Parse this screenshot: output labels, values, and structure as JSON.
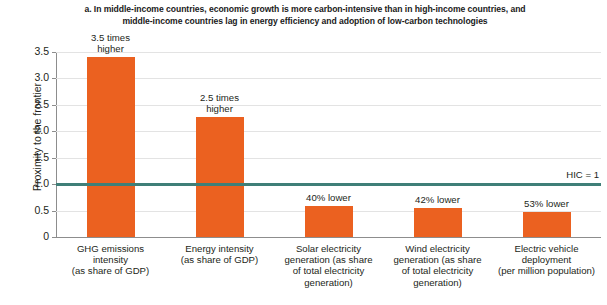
{
  "chart_data": {
    "type": "bar",
    "title": "a. In middle-income countries, economic growth is more carbon-intensive than in high-income countries, and middle-income countries lag in energy efficiency and adoption of low-carbon technologies",
    "title_lines": [
      "a. In middle-income countries, economic growth is more carbon-intensive than in high-income countries, and",
      "middle-income countries lag in energy efficiency and adoption of low-carbon technologies"
    ],
    "xlabel": "",
    "ylabel": "Proximity to the frontier",
    "ylim": [
      0,
      3.5
    ],
    "grid": true,
    "legend": "none",
    "bar_color": "#eb6120",
    "reference_line_color": "#3f7f78",
    "yticks": [
      "0",
      "0.5",
      "1.0",
      "1.5",
      "2.0",
      "2.5",
      "3.0",
      "3.5"
    ],
    "ytick_values": [
      0,
      0.5,
      1.0,
      1.5,
      2.0,
      2.5,
      3.0,
      3.5
    ],
    "categories": [
      "GHG emissions intensity (as share of GDP)",
      "Energy intensity (as share of GDP)",
      "Solar electricity generation (as share of total electricity generation)",
      "Wind electricity generation (as share of total electricity generation)",
      "Electric vehicle deployment (per million population)"
    ],
    "category_lines": [
      [
        "GHG emissions",
        "intensity",
        "(as share of GDP)"
      ],
      [
        "Energy intensity",
        "(as share of GDP)"
      ],
      [
        "Solar electricity",
        "generation (as share",
        "of total electricity",
        "generation)"
      ],
      [
        "Wind electricity",
        "generation (as share",
        "of total electricity",
        "generation)"
      ],
      [
        "Electric vehicle",
        "deployment",
        "(per million population)"
      ]
    ],
    "values": [
      3.41,
      2.27,
      0.58,
      0.55,
      0.47
    ],
    "annotations": [
      {
        "lines": [
          "3.5 times",
          "higher"
        ]
      },
      {
        "lines": [
          "2.5 times",
          "higher"
        ]
      },
      {
        "lines": [
          "40% lower"
        ]
      },
      {
        "lines": [
          "42% lower"
        ]
      },
      {
        "lines": [
          "53% lower"
        ]
      }
    ],
    "reference_line": {
      "value": 1.0,
      "label": "HIC = 1"
    }
  }
}
